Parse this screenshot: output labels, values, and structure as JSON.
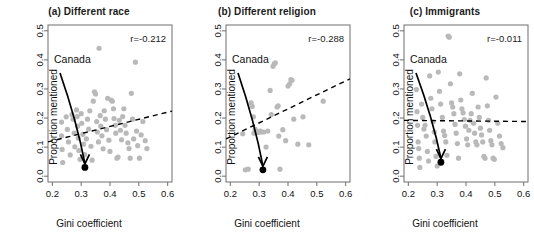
{
  "figure": {
    "panel_count": 3,
    "point_color": "#b9b9b9",
    "highlight_color": "#000000",
    "axis_color": "#6e6e6e",
    "trend_color": "#000000"
  },
  "chart_data": [
    {
      "type": "scatter",
      "panel_id": "a",
      "title": "(a) Different race",
      "xlabel": "Gini coefficient",
      "ylabel": "Proportion mentioned",
      "xlim": [
        0.185,
        0.615
      ],
      "ylim": [
        -0.02,
        0.52
      ],
      "xticks": [
        0.2,
        0.3,
        0.4,
        0.5,
        0.6
      ],
      "yticks": [
        0.0,
        0.1,
        0.2,
        0.3,
        0.4,
        0.5
      ],
      "xticklabels": [
        "0.2",
        "0.3",
        "0.4",
        "0.5",
        "0.6"
      ],
      "yticklabels": [
        "0.0",
        "0.1",
        "0.2",
        "0.3",
        "0.4",
        "0.5"
      ],
      "grid": false,
      "legend": "none",
      "annotation_r": "r=-0.212",
      "correlation": -0.212,
      "highlight_label": "Canada",
      "highlight_point": [
        0.313,
        0.03
      ],
      "trendline": {
        "type": "dashed",
        "x": [
          0.185,
          0.615
        ],
        "y": [
          0.118,
          0.224
        ]
      },
      "points": [
        [
          0.232,
          0.186
        ],
        [
          0.232,
          0.139
        ],
        [
          0.234,
          0.092
        ],
        [
          0.236,
          0.047
        ],
        [
          0.248,
          0.204
        ],
        [
          0.252,
          0.161
        ],
        [
          0.256,
          0.118
        ],
        [
          0.262,
          0.073
        ],
        [
          0.268,
          0.212
        ],
        [
          0.272,
          0.196
        ],
        [
          0.276,
          0.148
        ],
        [
          0.278,
          0.101
        ],
        [
          0.284,
          0.228
        ],
        [
          0.286,
          0.205
        ],
        [
          0.288,
          0.172
        ],
        [
          0.29,
          0.131
        ],
        [
          0.292,
          0.088
        ],
        [
          0.296,
          0.058
        ],
        [
          0.3,
          0.215
        ],
        [
          0.302,
          0.182
        ],
        [
          0.306,
          0.144
        ],
        [
          0.308,
          0.11
        ],
        [
          0.312,
          0.074
        ],
        [
          0.318,
          0.128
        ],
        [
          0.322,
          0.196
        ],
        [
          0.326,
          0.162
        ],
        [
          0.33,
          0.225
        ],
        [
          0.334,
          0.103
        ],
        [
          0.338,
          0.055
        ],
        [
          0.342,
          0.258
        ],
        [
          0.346,
          0.29
        ],
        [
          0.35,
          0.283
        ],
        [
          0.354,
          0.188
        ],
        [
          0.356,
          0.152
        ],
        [
          0.36,
          0.118
        ],
        [
          0.362,
          0.44
        ],
        [
          0.366,
          0.208
        ],
        [
          0.368,
          0.172
        ],
        [
          0.372,
          0.139
        ],
        [
          0.376,
          0.094
        ],
        [
          0.38,
          0.225
        ],
        [
          0.384,
          0.196
        ],
        [
          0.388,
          0.16
        ],
        [
          0.392,
          0.268
        ],
        [
          0.396,
          0.124
        ],
        [
          0.4,
          0.085
        ],
        [
          0.404,
          0.262
        ],
        [
          0.408,
          0.258
        ],
        [
          0.412,
          0.232
        ],
        [
          0.414,
          0.198
        ],
        [
          0.418,
          0.175
        ],
        [
          0.42,
          0.148
        ],
        [
          0.424,
          0.062
        ],
        [
          0.428,
          0.066
        ],
        [
          0.432,
          0.192
        ],
        [
          0.436,
          0.158
        ],
        [
          0.44,
          0.125
        ],
        [
          0.444,
          0.205
        ],
        [
          0.448,
          0.232
        ],
        [
          0.452,
          0.175
        ],
        [
          0.456,
          0.148
        ],
        [
          0.462,
          0.115
        ],
        [
          0.466,
          0.095
        ],
        [
          0.47,
          0.062
        ],
        [
          0.474,
          0.285
        ],
        [
          0.478,
          0.196
        ],
        [
          0.482,
          0.128
        ],
        [
          0.488,
          0.392
        ],
        [
          0.492,
          0.155
        ],
        [
          0.496,
          0.105
        ],
        [
          0.502,
          0.062
        ],
        [
          0.508,
          0.142
        ],
        [
          0.514,
          0.188
        ],
        [
          0.522,
          0.122
        ],
        [
          0.528,
          0.095
        ]
      ]
    },
    {
      "type": "scatter",
      "panel_id": "b",
      "title": "(b) Different religion",
      "xlabel": "Gini coefficient",
      "ylabel": "Proportion mentioned",
      "xlim": [
        0.185,
        0.615
      ],
      "ylim": [
        -0.02,
        0.52
      ],
      "xticks": [
        0.2,
        0.3,
        0.4,
        0.5,
        0.6
      ],
      "yticks": [
        0.0,
        0.1,
        0.2,
        0.3,
        0.4,
        0.5
      ],
      "xticklabels": [
        "0.2",
        "0.3",
        "0.4",
        "0.5",
        "0.6"
      ],
      "yticklabels": [
        "0.0",
        "0.1",
        "0.2",
        "0.3",
        "0.4",
        "0.5"
      ],
      "grid": false,
      "legend": "none",
      "annotation_r": "r=-0.288",
      "correlation": -0.288,
      "highlight_label": "Canada",
      "highlight_point": [
        0.313,
        0.022
      ],
      "trendline": {
        "type": "dashed",
        "x": [
          0.185,
          0.615
        ],
        "y": [
          0.128,
          0.335
        ]
      },
      "points": [
        [
          0.243,
          0.146
        ],
        [
          0.252,
          0.022
        ],
        [
          0.262,
          0.024
        ],
        [
          0.272,
          0.252
        ],
        [
          0.276,
          0.24
        ],
        [
          0.28,
          0.204
        ],
        [
          0.282,
          0.148
        ],
        [
          0.286,
          0.162
        ],
        [
          0.29,
          0.155
        ],
        [
          0.296,
          0.15
        ],
        [
          0.3,
          0.152
        ],
        [
          0.304,
          0.155
        ],
        [
          0.308,
          0.152
        ],
        [
          0.316,
          0.152
        ],
        [
          0.324,
          0.1
        ],
        [
          0.33,
          0.155
        ],
        [
          0.338,
          0.295
        ],
        [
          0.342,
          0.212
        ],
        [
          0.348,
          0.378
        ],
        [
          0.352,
          0.386
        ],
        [
          0.356,
          0.39
        ],
        [
          0.362,
          0.238
        ],
        [
          0.366,
          0.242
        ],
        [
          0.368,
          0.138
        ],
        [
          0.372,
          0.024
        ],
        [
          0.382,
          0.16
        ],
        [
          0.392,
          0.122
        ],
        [
          0.4,
          0.31
        ],
        [
          0.406,
          0.318
        ],
        [
          0.41,
          0.332
        ],
        [
          0.414,
          0.33
        ],
        [
          0.42,
          0.196
        ],
        [
          0.434,
          0.11
        ],
        [
          0.452,
          0.204
        ],
        [
          0.472,
          0.108
        ],
        [
          0.522,
          0.258
        ]
      ]
    },
    {
      "type": "scatter",
      "panel_id": "c",
      "title": "(c) Immigrants",
      "xlabel": "Gini coefficient",
      "ylabel": "Proportion mentioned",
      "xlim": [
        0.185,
        0.615
      ],
      "ylim": [
        -0.02,
        0.52
      ],
      "xticks": [
        0.2,
        0.3,
        0.4,
        0.5,
        0.6
      ],
      "yticks": [
        0.0,
        0.1,
        0.2,
        0.3,
        0.4,
        0.5
      ],
      "xticklabels": [
        "0.2",
        "0.3",
        "0.4",
        "0.5",
        "0.6"
      ],
      "yticklabels": [
        "0.0",
        "0.1",
        "0.2",
        "0.3",
        "0.4",
        "0.5"
      ],
      "grid": false,
      "legend": "none",
      "annotation_r": "r=-0.011",
      "correlation": -0.011,
      "highlight_label": "Canada",
      "highlight_point": [
        0.313,
        0.048
      ],
      "trendline": {
        "type": "dashed",
        "x": [
          0.185,
          0.615
        ],
        "y": [
          0.192,
          0.188
        ]
      },
      "points": [
        [
          0.228,
          0.298
        ],
        [
          0.23,
          0.222
        ],
        [
          0.232,
          0.175
        ],
        [
          0.234,
          0.118
        ],
        [
          0.236,
          0.095
        ],
        [
          0.238,
          0.062
        ],
        [
          0.24,
          0.03
        ],
        [
          0.246,
          0.248
        ],
        [
          0.25,
          0.202
        ],
        [
          0.254,
          0.162
        ],
        [
          0.258,
          0.175
        ],
        [
          0.262,
          0.138
        ],
        [
          0.266,
          0.085
        ],
        [
          0.27,
          0.052
        ],
        [
          0.274,
          0.345
        ],
        [
          0.278,
          0.268
        ],
        [
          0.282,
          0.232
        ],
        [
          0.286,
          0.188
        ],
        [
          0.29,
          0.152
        ],
        [
          0.292,
          0.118
        ],
        [
          0.296,
          0.068
        ],
        [
          0.3,
          0.035
        ],
        [
          0.304,
          0.358
        ],
        [
          0.308,
          0.292
        ],
        [
          0.312,
          0.248
        ],
        [
          0.318,
          0.202
        ],
        [
          0.322,
          0.155
        ],
        [
          0.326,
          0.14
        ],
        [
          0.33,
          0.118
        ],
        [
          0.334,
          0.072
        ],
        [
          0.338,
          0.482
        ],
        [
          0.342,
          0.478
        ],
        [
          0.346,
          0.318
        ],
        [
          0.35,
          0.252
        ],
        [
          0.354,
          0.238
        ],
        [
          0.358,
          0.215
        ],
        [
          0.362,
          0.178
        ],
        [
          0.366,
          0.148
        ],
        [
          0.37,
          0.112
        ],
        [
          0.374,
          0.062
        ],
        [
          0.378,
          0.352
        ],
        [
          0.382,
          0.262
        ],
        [
          0.386,
          0.232
        ],
        [
          0.39,
          0.218
        ],
        [
          0.394,
          0.195
        ],
        [
          0.398,
          0.172
        ],
        [
          0.402,
          0.128
        ],
        [
          0.406,
          0.108
        ],
        [
          0.41,
          0.158
        ],
        [
          0.414,
          0.192
        ],
        [
          0.418,
          0.215
        ],
        [
          0.422,
          0.285
        ],
        [
          0.426,
          0.182
        ],
        [
          0.43,
          0.148
        ],
        [
          0.434,
          0.118
        ],
        [
          0.438,
          0.108
        ],
        [
          0.442,
          0.238
        ],
        [
          0.446,
          0.202
        ],
        [
          0.45,
          0.165
        ],
        [
          0.454,
          0.142
        ],
        [
          0.458,
          0.118
        ],
        [
          0.462,
          0.068
        ],
        [
          0.466,
          0.062
        ],
        [
          0.47,
          0.338
        ],
        [
          0.474,
          0.242
        ],
        [
          0.478,
          0.192
        ],
        [
          0.482,
          0.158
        ],
        [
          0.486,
          0.122
        ],
        [
          0.49,
          0.108
        ],
        [
          0.494,
          0.062
        ],
        [
          0.498,
          0.058
        ],
        [
          0.504,
          0.272
        ],
        [
          0.51,
          0.182
        ],
        [
          0.516,
          0.138
        ],
        [
          0.522,
          0.112
        ],
        [
          0.528,
          0.098
        ]
      ]
    }
  ]
}
